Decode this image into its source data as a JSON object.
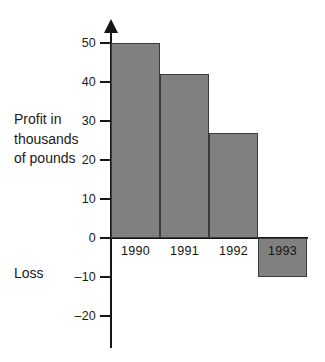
{
  "chart_data": {
    "type": "bar",
    "title": "",
    "xlabel": "",
    "ylabel": "Profit in thousands of pounds",
    "categories": [
      "1990",
      "1991",
      "1992",
      "1993"
    ],
    "values": [
      50,
      42,
      27,
      -10
    ],
    "ylim": [
      -20,
      50
    ],
    "yticks": [
      50,
      40,
      30,
      20,
      10,
      0,
      -10,
      -20
    ],
    "ytick_labels": [
      "50",
      "40",
      "30",
      "20",
      "10",
      "0",
      "–10",
      "–20"
    ],
    "grid": false,
    "legend": false,
    "bar_color": "#808080",
    "bar_border_color": "#3b3b3b",
    "axis_color": "#161616",
    "annotations": [
      {
        "text": "Profit in thousands of pounds",
        "position": "left-of-axis-upper"
      },
      {
        "text": "Loss",
        "position": "left-of-axis-lower"
      }
    ]
  },
  "axis_title": {
    "line1": "Profit in",
    "line2": "thousands",
    "line3": "of pounds"
  },
  "loss_label": "Loss"
}
